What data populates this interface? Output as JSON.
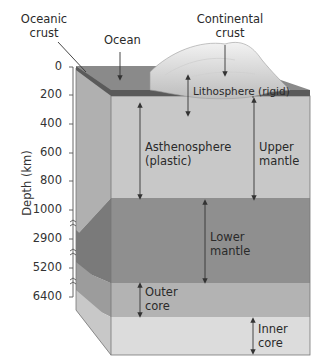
{
  "diagram": {
    "type": "earth-layer-cross-section-block",
    "top_labels": {
      "oceanic_crust": [
        "Oceanic",
        "crust"
      ],
      "ocean": "Ocean",
      "continental_crust": [
        "Continental",
        "crust"
      ]
    },
    "axis": {
      "label": "Depth (km)",
      "ticks": [
        "0",
        "200",
        "400",
        "600",
        "800",
        "1000",
        "2900",
        "5200",
        "6400"
      ],
      "breaks_after": [
        "1000",
        "2900",
        "5200"
      ]
    },
    "layers": [
      {
        "name": "Lithosphere (rigid)",
        "color": "#c9c9c9"
      },
      {
        "name": "Asthenosphere",
        "sub": "(plastic)",
        "color": "#c8c8c8"
      },
      {
        "name": "Lower mantle",
        "color": "#8f8f8f"
      },
      {
        "name": "Outer core",
        "color": "#b3b3b3"
      },
      {
        "name": "Inner core",
        "color": "#dcdcdc"
      }
    ],
    "region_labels": {
      "lithosphere": "Lithosphere (rigid)",
      "asthenosphere": [
        "Asthenosphere",
        "(plastic)"
      ],
      "upper_mantle": [
        "Upper",
        "mantle"
      ],
      "lower_mantle": [
        "Lower",
        "mantle"
      ],
      "outer_core": [
        "Outer",
        "core"
      ],
      "inner_core": [
        "Inner",
        "core"
      ]
    },
    "colors": {
      "ocean_surface": "#8a8a8a",
      "crust_band": "#5a5a5a",
      "upper_mantle_front": "#c8c8c8",
      "upper_mantle_side": "#b0b0b0",
      "lower_mantle_front": "#8f8f8f",
      "lower_mantle_side": "#7a7a7a",
      "outer_core_front": "#b3b3b3",
      "outer_core_side": "#9c9c9c",
      "inner_core_front": "#dcdcdc",
      "inner_core_side": "#c8c8c8",
      "arrow": "#333333"
    }
  }
}
